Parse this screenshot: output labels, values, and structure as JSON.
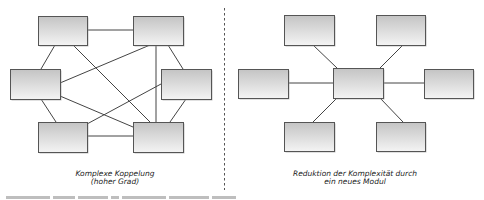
{
  "colors": {
    "box_top": "#c4c4c4",
    "box_bottom": "#f4f4f4",
    "box_border": "#555555",
    "box_shadow": "#9a9a9a",
    "line": "#444444",
    "divider": "#555555",
    "caption_text": "#222222"
  },
  "left_diagram": {
    "title_line1": "Komplexe Koppelung",
    "title_line2": "(hoher Grad)",
    "nodes": [
      {
        "id": "tl",
        "x": 38,
        "y": 16,
        "w": 49,
        "h": 29
      },
      {
        "id": "tr",
        "x": 133,
        "y": 16,
        "w": 50,
        "h": 29
      },
      {
        "id": "ml",
        "x": 10,
        "y": 69,
        "w": 50,
        "h": 30
      },
      {
        "id": "mr",
        "x": 161,
        "y": 69,
        "w": 50,
        "h": 30
      },
      {
        "id": "bl",
        "x": 38,
        "y": 122,
        "w": 49,
        "h": 30
      },
      {
        "id": "br",
        "x": 133,
        "y": 122,
        "w": 50,
        "h": 30
      }
    ],
    "edges": [
      {
        "x1": 87,
        "y1": 30,
        "x2": 133,
        "y2": 30
      },
      {
        "x1": 55,
        "y1": 45,
        "x2": 41,
        "y2": 69
      },
      {
        "x1": 73,
        "y1": 45,
        "x2": 150,
        "y2": 122
      },
      {
        "x1": 150,
        "y1": 45,
        "x2": 60,
        "y2": 83
      },
      {
        "x1": 156,
        "y1": 45,
        "x2": 156,
        "y2": 122
      },
      {
        "x1": 168,
        "y1": 45,
        "x2": 183,
        "y2": 69
      },
      {
        "x1": 41,
        "y1": 99,
        "x2": 56,
        "y2": 122
      },
      {
        "x1": 60,
        "y1": 96,
        "x2": 133,
        "y2": 127
      },
      {
        "x1": 161,
        "y1": 84,
        "x2": 87,
        "y2": 124
      },
      {
        "x1": 186,
        "y1": 99,
        "x2": 170,
        "y2": 122
      },
      {
        "x1": 87,
        "y1": 136,
        "x2": 133,
        "y2": 136
      }
    ]
  },
  "right_diagram": {
    "title_line1": "Reduktion der Komplexität durch",
    "title_line2": "ein neues Modul",
    "nodes": [
      {
        "id": "center",
        "x": 333,
        "y": 68,
        "w": 50,
        "h": 30
      },
      {
        "id": "tl",
        "x": 284,
        "y": 15,
        "w": 50,
        "h": 30
      },
      {
        "id": "tr",
        "x": 376,
        "y": 15,
        "w": 49,
        "h": 30
      },
      {
        "id": "l",
        "x": 238,
        "y": 69,
        "w": 50,
        "h": 29
      },
      {
        "id": "r",
        "x": 424,
        "y": 69,
        "w": 49,
        "h": 29
      },
      {
        "id": "bl",
        "x": 284,
        "y": 122,
        "w": 50,
        "h": 29
      },
      {
        "id": "br",
        "x": 376,
        "y": 122,
        "w": 49,
        "h": 29
      }
    ],
    "edges": [
      {
        "x1": 313,
        "y1": 45,
        "x2": 337,
        "y2": 68
      },
      {
        "x1": 403,
        "y1": 45,
        "x2": 380,
        "y2": 68
      },
      {
        "x1": 288,
        "y1": 83,
        "x2": 333,
        "y2": 83
      },
      {
        "x1": 383,
        "y1": 83,
        "x2": 424,
        "y2": 83
      },
      {
        "x1": 337,
        "y1": 98,
        "x2": 313,
        "y2": 122
      },
      {
        "x1": 380,
        "y1": 98,
        "x2": 403,
        "y2": 122
      }
    ]
  },
  "divider": {
    "x": 224,
    "y1": 8,
    "y2": 190
  }
}
